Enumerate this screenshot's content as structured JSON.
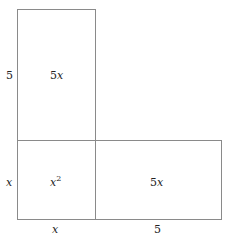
{
  "diagram": {
    "title": "",
    "regions": [
      {
        "id": "top",
        "label": "5x",
        "label_main": "5",
        "label_var": "x"
      },
      {
        "id": "bottom-left",
        "label": "x^2",
        "label_var": "x",
        "label_exp": "2"
      },
      {
        "id": "bottom-right",
        "label": "5x",
        "label_main": "5",
        "label_var": "x"
      }
    ],
    "side_labels": {
      "left_top": "5",
      "left_bottom": "x",
      "bottom_left": "x",
      "bottom_right": "5"
    },
    "line_color": "#888888"
  }
}
